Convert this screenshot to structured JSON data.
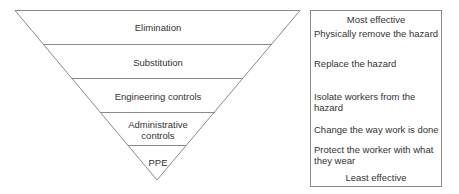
{
  "levels": [
    {
      "label": "Elimination",
      "description": "Physically remove the hazard"
    },
    {
      "label": "Substitution",
      "description": "Replace the hazard"
    },
    {
      "label": "Engineering controls",
      "description": "Isolate workers from the hazard"
    },
    {
      "label": "Administrative controls",
      "label_line1": "Administrative",
      "label_line2": "controls",
      "description": "Change the way work is done"
    },
    {
      "label": "PPE",
      "description": "Protect the worker with what they wear",
      "description_line1": "Protect the worker with what",
      "description_line2": "they wear"
    }
  ],
  "scale": {
    "top_label": "Most effective",
    "bottom_label": "Least effective"
  },
  "colors": {
    "lines": "#888888",
    "text": "#333333"
  }
}
